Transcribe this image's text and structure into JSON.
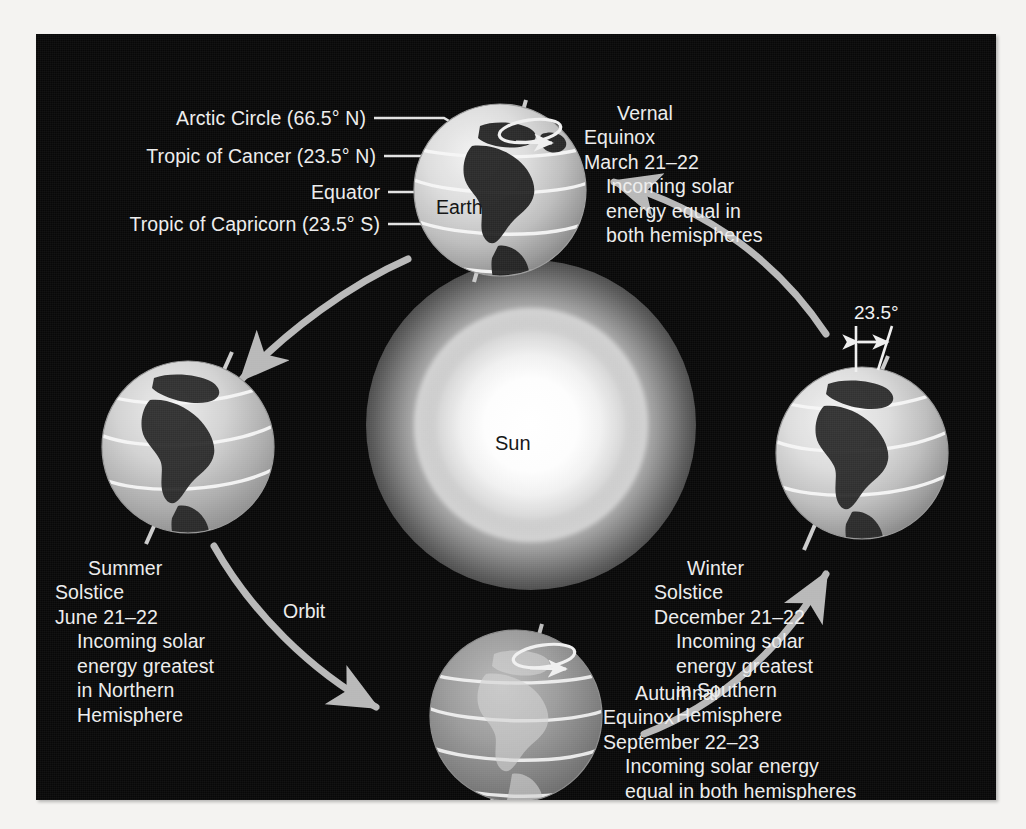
{
  "figure": {
    "background_color": "#080808",
    "text_color": "#ededed",
    "globe_light_color": "#d9d9d9",
    "globe_shadow_color": "#6e6e6e",
    "arrow_color": "#b8b8b8"
  },
  "callouts": {
    "arctic_circle": "Arctic Circle (66.5° N)",
    "tropic_of_cancer": "Tropic of Cancer (23.5° N)",
    "equator": "Equator",
    "tropic_of_capricorn": "Tropic of Capricorn (23.5° S)"
  },
  "sun": {
    "label": "Sun"
  },
  "earth": {
    "label": "Earth"
  },
  "orbit": {
    "label": "Orbit"
  },
  "tilt": {
    "label": "23.5°"
  },
  "seasons": {
    "vernal_equinox": {
      "name_line1": "Vernal",
      "name_line2": "Equinox",
      "date": "March 21–22",
      "detail_line1": "Incoming solar",
      "detail_line2": "energy equal in",
      "detail_line3": "both hemispheres"
    },
    "summer_solstice": {
      "name_line1": "Summer",
      "name_line2": "Solstice",
      "date": "June 21–22",
      "detail_line1": "Incoming solar",
      "detail_line2": "energy greatest",
      "detail_line3": "in Northern",
      "detail_line4": "Hemisphere"
    },
    "autumnal_equinox": {
      "name_line1": "Autumnal",
      "name_line2": "Equinox",
      "date": "September 22–23",
      "detail_line1": "Incoming solar energy",
      "detail_line2": "equal in both hemispheres"
    },
    "winter_solstice": {
      "name_line1": "Winter",
      "name_line2": "Solstice",
      "date": "December 21–22",
      "detail_line1": "Incoming solar",
      "detail_line2": "energy greatest",
      "detail_line3": "in Southern",
      "detail_line4": "Hemisphere"
    }
  }
}
